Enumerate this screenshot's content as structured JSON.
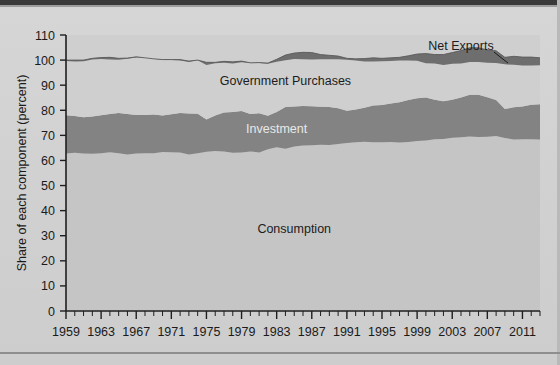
{
  "chart_data": {
    "type": "area",
    "title": "",
    "subtitle": "",
    "xlabel": "",
    "ylabel": "Share of each component (percent)",
    "xlim": [
      1959,
      2013
    ],
    "ylim": [
      0,
      110
    ],
    "ytick_step": 10,
    "yticks": [
      0,
      10,
      20,
      30,
      40,
      50,
      60,
      70,
      80,
      90,
      100,
      110
    ],
    "xticks": [
      1959,
      1963,
      1967,
      1971,
      1975,
      1979,
      1983,
      1987,
      1991,
      1995,
      1999,
      2003,
      2007,
      2011
    ],
    "xtick_labels": [
      "1959",
      "1963",
      "1967",
      "1971",
      "1975",
      "1979",
      "1983",
      "1987",
      "1991",
      "1995",
      "1999",
      "2003",
      "2007",
      "2011"
    ],
    "minor_xtick_interval": 1,
    "grid": false,
    "legend_position": "inline-annotations",
    "stacked": true,
    "annotations": [
      {
        "name": "consumption-label",
        "text": "Consumption",
        "x": 1985,
        "y": 31,
        "style": "dark"
      },
      {
        "name": "investment-label",
        "text": "Investment",
        "x": 1983,
        "y": 71,
        "style": "light"
      },
      {
        "name": "government-purchases-label",
        "text": "Government Purchases",
        "x": 1984,
        "y": 90,
        "style": "dark"
      },
      {
        "name": "net-exports-label",
        "text": "Net Exports",
        "x": 2004,
        "y": 104,
        "style": "dark",
        "leader_line": true
      }
    ],
    "colors": {
      "consumption": "#c5c5c5",
      "investment": "#838383",
      "government_purchases": "#cfcfcf",
      "net_exports": "#6e6e6e",
      "background": "#d2d2d2",
      "plot_background": "#cfcfcf",
      "axis": "#1f1f1f",
      "text": "#1a1a1a"
    },
    "x": [
      1959,
      1960,
      1961,
      1962,
      1963,
      1964,
      1965,
      1966,
      1967,
      1968,
      1969,
      1970,
      1971,
      1972,
      1973,
      1974,
      1975,
      1976,
      1977,
      1978,
      1979,
      1980,
      1981,
      1982,
      1983,
      1984,
      1985,
      1986,
      1987,
      1988,
      1989,
      1990,
      1991,
      1992,
      1993,
      1994,
      1995,
      1996,
      1997,
      1998,
      1999,
      2000,
      2001,
      2002,
      2003,
      2004,
      2005,
      2006,
      2007,
      2008,
      2009,
      2010,
      2011,
      2012,
      2013
    ],
    "series": [
      {
        "name": "Consumption",
        "color": "#c5c5c5",
        "values": [
          62.8,
          63.1,
          62.8,
          62.7,
          62.9,
          63.3,
          62.9,
          62.4,
          62.8,
          62.9,
          62.9,
          63.4,
          63.3,
          63.2,
          62.4,
          62.9,
          63.5,
          63.8,
          63.6,
          63.1,
          63.2,
          63.6,
          63.2,
          64.5,
          65.3,
          64.7,
          65.6,
          66.0,
          66.1,
          66.3,
          66.2,
          66.6,
          67.0,
          67.3,
          67.5,
          67.3,
          67.3,
          67.4,
          67.2,
          67.4,
          67.8,
          68.0,
          68.5,
          68.6,
          69.0,
          69.2,
          69.5,
          69.3,
          69.4,
          69.7,
          68.9,
          68.4,
          68.5,
          68.5,
          68.4
        ]
      },
      {
        "name": "Investment",
        "color": "#838383",
        "values": [
          15.2,
          14.6,
          14.4,
          14.8,
          15.1,
          15.2,
          16.0,
          16.1,
          15.3,
          15.2,
          15.4,
          14.5,
          15.1,
          15.7,
          16.3,
          15.7,
          12.8,
          14.1,
          15.5,
          16.2,
          16.5,
          14.9,
          15.6,
          13.3,
          14.0,
          16.6,
          15.9,
          15.7,
          15.5,
          15.1,
          15.1,
          14.2,
          12.8,
          13.0,
          13.5,
          14.6,
          14.8,
          15.3,
          16.0,
          16.7,
          17.0,
          17.1,
          15.7,
          15.0,
          15.2,
          15.9,
          16.7,
          16.9,
          15.8,
          14.4,
          11.6,
          12.8,
          13.0,
          13.7,
          14.0
        ]
      },
      {
        "name": "Government Purchases",
        "color": "#cfcfcf",
        "values": [
          21.6,
          21.7,
          22.3,
          22.7,
          22.4,
          21.7,
          21.2,
          22.0,
          22.9,
          22.8,
          22.2,
          22.1,
          21.8,
          21.3,
          20.5,
          21.3,
          21.7,
          20.8,
          20.4,
          20.0,
          19.9,
          20.4,
          20.2,
          21.0,
          21.0,
          20.7,
          21.3,
          21.4,
          21.4,
          20.8,
          20.6,
          20.8,
          20.9,
          20.2,
          19.6,
          19.0,
          18.6,
          18.2,
          17.9,
          17.6,
          17.6,
          17.5,
          18.0,
          18.6,
          18.8,
          18.7,
          18.7,
          18.7,
          18.8,
          19.6,
          20.6,
          20.3,
          19.7,
          19.0,
          18.5
        ]
      },
      {
        "name": "Net Exports",
        "color": "#6e6e6e",
        "values": [
          0.4,
          0.6,
          0.5,
          0.5,
          0.6,
          0.9,
          0.6,
          0.3,
          0.3,
          0.0,
          0.0,
          0.2,
          -0.2,
          -0.4,
          0.4,
          0.1,
          1.1,
          0.4,
          -0.6,
          -0.7,
          -0.5,
          -0.1,
          -0.2,
          -0.3,
          -1.0,
          -2.1,
          -2.4,
          -2.8,
          -2.8,
          -1.9,
          -1.6,
          -1.3,
          -0.6,
          -0.7,
          -1.2,
          -1.5,
          -1.2,
          -1.3,
          -1.3,
          -1.9,
          -2.7,
          -3.9,
          -3.6,
          -4.2,
          -4.5,
          -5.2,
          -5.7,
          -5.7,
          -5.1,
          -4.9,
          -2.8,
          -3.4,
          -3.4,
          -3.4,
          -3.0
        ]
      }
    ]
  },
  "axis": {
    "y_title": "Share of each component (percent)",
    "y_tick_labels": [
      "110",
      "100",
      "90",
      "80",
      "70",
      "60",
      "50",
      "40",
      "30",
      "20",
      "10",
      "0"
    ],
    "x_tick_labels": [
      "1959",
      "1963",
      "1967",
      "1971",
      "1975",
      "1979",
      "1983",
      "1987",
      "1991",
      "1995",
      "1999",
      "2003",
      "2007",
      "2011"
    ]
  },
  "labels": {
    "consumption": "Consumption",
    "investment": "Investment",
    "government_purchases": "Government Purchases",
    "net_exports": "Net Exports"
  }
}
